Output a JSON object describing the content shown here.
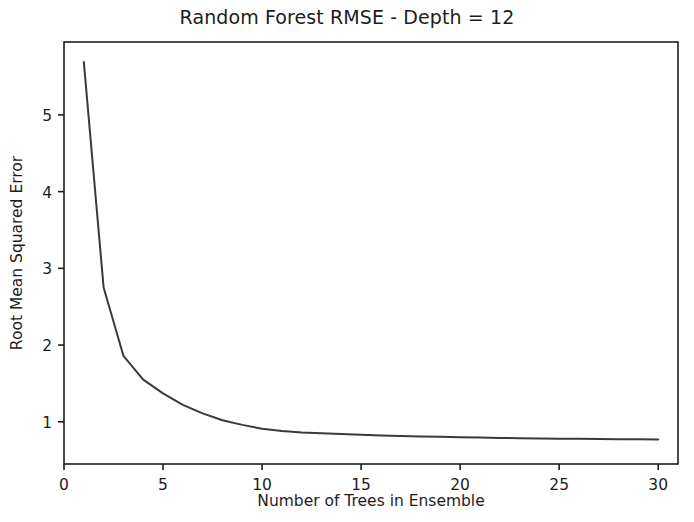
{
  "chart_data": {
    "type": "line",
    "title": "Random Forest RMSE - Depth = 12",
    "xlabel": "Number of Trees in Ensemble",
    "ylabel": "Root Mean Squared Error",
    "xlim": [
      0,
      31
    ],
    "ylim": [
      0.45,
      5.95
    ],
    "grid": false,
    "legend": null,
    "xticks": [
      0,
      5,
      10,
      15,
      20,
      25,
      30
    ],
    "xtick_labels": [
      "0",
      "5",
      "10",
      "15",
      "20",
      "25",
      "30"
    ],
    "yticks": [
      1,
      2,
      3,
      4,
      5
    ],
    "ytick_labels": [
      "1",
      "2",
      "3",
      "4",
      "5"
    ],
    "line_color": "#3a3a3a",
    "line_width": 2,
    "x": [
      1,
      2,
      3,
      4,
      5,
      6,
      7,
      8,
      9,
      10,
      11,
      12,
      13,
      14,
      15,
      16,
      17,
      18,
      19,
      20,
      21,
      22,
      23,
      24,
      25,
      26,
      27,
      28,
      29,
      30
    ],
    "values": [
      5.69,
      2.75,
      1.86,
      1.55,
      1.37,
      1.22,
      1.11,
      1.02,
      0.96,
      0.91,
      0.88,
      0.86,
      0.85,
      0.84,
      0.83,
      0.82,
      0.815,
      0.81,
      0.805,
      0.8,
      0.795,
      0.79,
      0.785,
      0.783,
      0.78,
      0.778,
      0.776,
      0.774,
      0.772,
      0.77
    ],
    "series": [
      {
        "name": "RMSE",
        "values": [
          5.69,
          2.75,
          1.86,
          1.55,
          1.37,
          1.22,
          1.11,
          1.02,
          0.96,
          0.91,
          0.88,
          0.86,
          0.85,
          0.84,
          0.83,
          0.82,
          0.815,
          0.81,
          0.805,
          0.8,
          0.795,
          0.79,
          0.785,
          0.783,
          0.78,
          0.778,
          0.776,
          0.774,
          0.772,
          0.77
        ]
      }
    ]
  },
  "axes": {
    "frame_color": "#1d1d1d"
  }
}
